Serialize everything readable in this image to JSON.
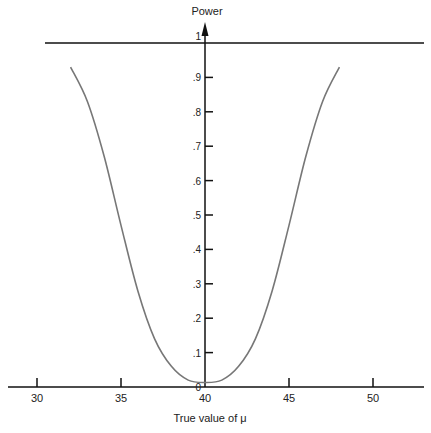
{
  "chart_data": {
    "type": "line",
    "title": "",
    "xlabel": "True value of μ",
    "ylabel": "Power",
    "xlim": [
      27.5,
      53.0
    ],
    "ylim": [
      0,
      1
    ],
    "x_ticks": [
      30,
      35,
      40,
      45,
      50
    ],
    "x_tick_labels": [
      "30",
      "35",
      "40",
      "45",
      "50"
    ],
    "y_ticks": [
      0,
      0.1,
      0.2,
      0.3,
      0.4,
      0.5,
      0.6,
      0.7,
      0.8,
      0.9,
      1
    ],
    "y_tick_labels": [
      "0",
      ".1",
      ".2",
      ".3",
      ".4",
      ".5",
      ".6",
      ".7",
      ".8",
      ".9",
      "1"
    ],
    "grid": false,
    "legend": null,
    "reference_line": {
      "y": 1,
      "description": "horizontal line at power = 1"
    },
    "y_axis_position_x": 40,
    "series": [
      {
        "name": "Power curve",
        "color": "#777777",
        "x": [
          32,
          33,
          34,
          35,
          36,
          37,
          38,
          39,
          40,
          41,
          42,
          43,
          44,
          45,
          46,
          47,
          48
        ],
        "values": [
          0.93,
          0.83,
          0.67,
          0.47,
          0.28,
          0.14,
          0.06,
          0.02,
          0.013,
          0.02,
          0.06,
          0.14,
          0.28,
          0.47,
          0.67,
          0.83,
          0.93
        ]
      }
    ]
  },
  "colors": {
    "axis": "#111111",
    "curve": "#777777",
    "background": "#ffffff"
  }
}
